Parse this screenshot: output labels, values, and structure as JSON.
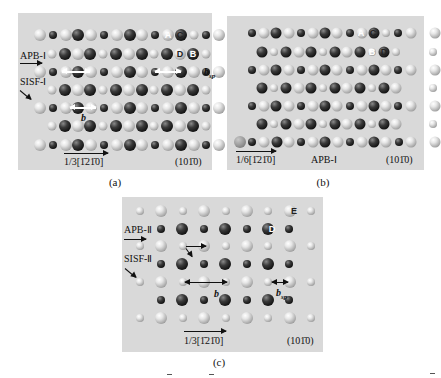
{
  "figure": {
    "panels": [
      {
        "id": "a",
        "caption": "(a)",
        "frame": {
          "x": 18,
          "y": 13,
          "w": 194,
          "h": 157
        },
        "bg": "#d9d9d9",
        "labels": {
          "apb": "APB-Ⅰ",
          "sisf": "SISF-Ⅰ",
          "direction": "1/3[",
          "direction_idx": "1210",
          "direction_full": "1/3[1̄21̄0]",
          "plane": "(101̄0)",
          "burgers": "b",
          "burgers_sp": "b",
          "burgers_sp_sub": "sp"
        },
        "atom_labels": [
          {
            "text": "A",
            "on": "dark"
          },
          {
            "text": "C",
            "on": "light"
          },
          {
            "text": "D",
            "on": "light"
          },
          {
            "text": "B",
            "on": "dark"
          }
        ]
      },
      {
        "id": "b",
        "caption": "(b)",
        "frame": {
          "x": 227,
          "y": 16,
          "w": 197,
          "h": 154
        },
        "bg": "#d9d9d9",
        "labels": {
          "apb": "APB-Ⅰ",
          "direction_full": "1/6[1̄21̄0]",
          "plane": "(101̄0)"
        },
        "atom_labels": [
          {
            "text": "A",
            "on": "dark"
          },
          {
            "text": "C",
            "on": "light"
          },
          {
            "text": "B",
            "on": "dark"
          },
          {
            "text": "D",
            "on": "light"
          }
        ]
      },
      {
        "id": "c",
        "caption": "(c)",
        "frame": {
          "x": 122,
          "y": 197,
          "w": 201,
          "h": 155
        },
        "bg": "#d9d9d9",
        "labels": {
          "apb": "APB-Ⅱ",
          "sisf": "SISF-Ⅱ",
          "direction_full": "1/3[1̄21̄0]",
          "plane": "(101̄0)",
          "burgers": "b",
          "burgers_sp": "b",
          "burgers_sp_sub": "sp"
        },
        "atom_labels": [
          {
            "text": "E",
            "on": "light"
          },
          {
            "text": "D",
            "on": "dark"
          }
        ]
      }
    ],
    "legend_key": {
      "L": "large light atom",
      "S": "small light atom",
      "D": "large dark atom",
      "d": "small dark atom",
      "G": "gray atom"
    },
    "rows_a": [
      {
        "y": 35,
        "x0": 40,
        "dx": 12.8,
        "atoms": [
          "L",
          "d",
          "L",
          "D",
          "L",
          "d",
          "L",
          "D",
          "L",
          "d",
          "L",
          "D",
          "S",
          "d",
          "L"
        ]
      },
      {
        "y": 54,
        "x0": 52,
        "dx": 12.8,
        "atoms": [
          "S",
          "D",
          "L",
          "D",
          "S",
          "D",
          "L",
          "D",
          "S",
          "D",
          "L",
          "D",
          "S"
        ]
      },
      {
        "y": 72,
        "x0": 40,
        "dx": 12.8,
        "atoms": [
          "L",
          "d",
          "L",
          "D",
          "L",
          "d",
          "L",
          "D",
          "L",
          "d",
          "L",
          "D",
          "L",
          "d",
          "L"
        ]
      },
      {
        "y": 90,
        "x0": 52,
        "dx": 12.8,
        "atoms": [
          "S",
          "D",
          "L",
          "D",
          "S",
          "D",
          "L",
          "D",
          "S",
          "D",
          "L",
          "D",
          "S"
        ]
      },
      {
        "y": 108,
        "x0": 40,
        "dx": 12.8,
        "atoms": [
          "L",
          "d",
          "L",
          "D",
          "L",
          "d",
          "L",
          "D",
          "L",
          "d",
          "L",
          "D",
          "L",
          "d",
          "L"
        ]
      },
      {
        "y": 126,
        "x0": 52,
        "dx": 12.8,
        "atoms": [
          "S",
          "D",
          "L",
          "D",
          "S",
          "D",
          "L",
          "D",
          "S",
          "D",
          "L",
          "D",
          "S"
        ]
      },
      {
        "y": 145,
        "x0": 40,
        "dx": 12.8,
        "atoms": [
          "L",
          "d",
          "L",
          "D",
          "L",
          "d",
          "L",
          "D",
          "L",
          "d",
          "L",
          "D",
          "L",
          "d",
          "L"
        ]
      }
    ],
    "rows_b": [
      {
        "y": 33,
        "x0": 252,
        "dx": 12.2,
        "atoms": [
          "d",
          "L",
          "D",
          "L",
          "d",
          "L",
          "D",
          "L",
          "d",
          "L",
          "D",
          "S",
          "d",
          "L",
          "",
          "L"
        ]
      },
      {
        "y": 52,
        "x0": 262,
        "dx": 12.2,
        "atoms": [
          "D",
          "S",
          "D",
          "L",
          "D",
          "S",
          "D",
          "L",
          "D",
          "S",
          "D",
          "S",
          "",
          "",
          "S"
        ]
      },
      {
        "y": 70,
        "x0": 252,
        "dx": 12.2,
        "atoms": [
          "d",
          "L",
          "D",
          "L",
          "d",
          "L",
          "D",
          "L",
          "d",
          "L",
          "D",
          "L",
          "d",
          "L",
          "",
          "L"
        ]
      },
      {
        "y": 88,
        "x0": 262,
        "dx": 12.2,
        "atoms": [
          "D",
          "S",
          "D",
          "L",
          "D",
          "S",
          "D",
          "L",
          "D",
          "S",
          "D",
          "L",
          "",
          "",
          "S"
        ]
      },
      {
        "y": 106,
        "x0": 252,
        "dx": 12.2,
        "atoms": [
          "d",
          "L",
          "D",
          "L",
          "d",
          "L",
          "D",
          "L",
          "d",
          "L",
          "D",
          "L",
          "d",
          "L",
          "",
          "L"
        ]
      },
      {
        "y": 124,
        "x0": 262,
        "dx": 12.2,
        "atoms": [
          "D",
          "S",
          "D",
          "L",
          "D",
          "S",
          "D",
          "L",
          "D",
          "S",
          "D",
          "L",
          "",
          "",
          "S"
        ]
      },
      {
        "y": 142,
        "x0": 240,
        "dx": 12.2,
        "atoms": [
          "G",
          "d",
          "L",
          "D",
          "L",
          "d",
          "L",
          "D",
          "L",
          "d",
          "L",
          "D",
          "L",
          "d",
          "L",
          "",
          "L"
        ]
      }
    ],
    "rows_c": [
      {
        "y": 211,
        "x0": 140,
        "dx": 21.4,
        "atoms": [
          "S",
          "L",
          "S",
          "L",
          "S",
          "L",
          "S",
          "L",
          "S"
        ]
      },
      {
        "y": 229,
        "x0": 161,
        "dx": 21.4,
        "atoms": [
          "d",
          "D",
          "d",
          "D",
          "d",
          "D",
          "d"
        ]
      },
      {
        "y": 246,
        "x0": 140,
        "dx": 21.4,
        "atoms": [
          "S",
          "L",
          "S",
          "L",
          "S",
          "L",
          "S",
          "L",
          "S"
        ]
      },
      {
        "y": 264,
        "x0": 161,
        "dx": 21.4,
        "atoms": [
          "d",
          "D",
          "d",
          "D",
          "d",
          "D",
          "d"
        ]
      },
      {
        "y": 282,
        "x0": 140,
        "dx": 21.4,
        "atoms": [
          "S",
          "L",
          "S",
          "L",
          "S",
          "L",
          "S",
          "L",
          "S"
        ]
      },
      {
        "y": 300,
        "x0": 161,
        "dx": 21.4,
        "atoms": [
          "d",
          "D",
          "d",
          "D",
          "d",
          "D",
          "d"
        ]
      },
      {
        "y": 318,
        "x0": 140,
        "dx": 21.4,
        "atoms": [
          "S",
          "L",
          "S",
          "L",
          "S",
          "L",
          "S",
          "L",
          "S"
        ]
      }
    ]
  }
}
